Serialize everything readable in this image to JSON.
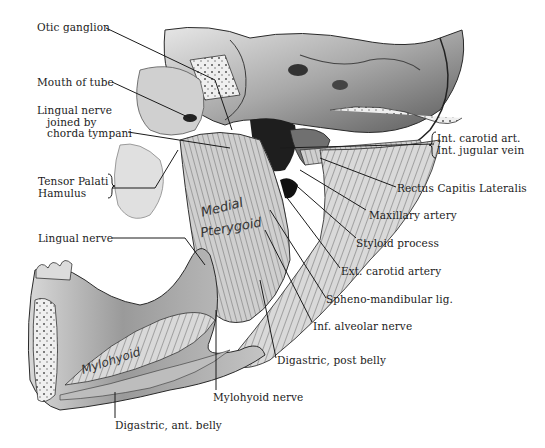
{
  "figure": {
    "type": "anatomical-illustration",
    "palette": {
      "background": "#ffffff",
      "ink": "#1b1b1b",
      "shade_dark": "#2a2a2a",
      "shade_mid": "#8a8a8a",
      "shade_light": "#d6d6d6"
    }
  },
  "inline_labels": {
    "medial": "Medial",
    "pterygoid": "Pterygoid",
    "mylohyoid": "Mylohyoid"
  },
  "labels": {
    "otic_ganglion": "Otic ganglion",
    "mouth_of_tube": "Mouth of tube",
    "lingual_nerve_chorda_1": "Lingual nerve",
    "lingual_nerve_chorda_2": "joined by",
    "lingual_nerve_chorda_3": "chorda tympani",
    "tensor_palati": "Tensor Palati",
    "hamulus": "Hamulus",
    "lingual_nerve": "Lingual nerve",
    "int_carotid_art": "Int. carotid art.",
    "int_jugular_vein": "Int. jugular vein",
    "rectus_capitis_lateralis": "Rectus Capitis Lateralis",
    "maxillary_artery": "Maxillary artery",
    "styloid_process": "Styloid process",
    "ext_carotid_artery": "Ext. carotid artery",
    "spheno_mandibular_lig": "Spheno-mandibular lig.",
    "inf_alveolar_nerve": "Inf. alveolar nerve",
    "digastric_post_belly": "Digastric, post belly",
    "mylohyoid_nerve": "Mylohyoid nerve",
    "digastric_ant_belly": "Digastric, ant. belly"
  }
}
